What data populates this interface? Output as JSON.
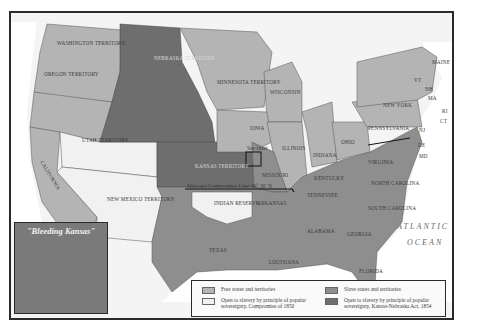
{
  "map": {
    "title": "Kansas-Nebraska Act, 1854",
    "colors": {
      "free": "#b4b4b4",
      "slave": "#8e8e8e",
      "open_1850": "#f1f1f1",
      "open_1854": "#6e6e6e",
      "water": "#ffffff",
      "background": "#f4f4f4"
    },
    "territories": {
      "washington": "WASHINGTON TERRITORY",
      "oregon": "OREGON TERRITORY",
      "nebraska": "NEBRASKA TERRITORY",
      "minnesota": "MINNESOTA TERRITORY",
      "utah": "UTAH TERRITORY",
      "new_mexico": "NEW MEXICO TERRITORY",
      "kansas": "KANSAS TERRITORY",
      "indian_reserve": "INDIAN RESERVE"
    },
    "states": {
      "california": "CALIFORNIA",
      "wisconsin": "WISCONSIN",
      "michigan": "MICHIGAN",
      "iowa": "IOWA",
      "illinois": "ILLINOIS",
      "indiana": "INDIANA",
      "ohio": "OHIO",
      "missouri": "MISSOURI",
      "arkansas": "ARKANSAS",
      "texas": "TEXAS",
      "louisiana": "LOUISIANA",
      "mississippi": "MISSISSIPPI",
      "alabama": "ALABAMA",
      "georgia": "GEORGIA",
      "florida": "FLORIDA",
      "tennessee": "TENNESSEE",
      "kentucky": "KENTUCKY",
      "virginia": "VIRGINIA",
      "north_carolina": "NORTH CAROLINA",
      "south_carolina": "SOUTH CAROLINA",
      "pennsylvania": "PENNSYLVANIA",
      "new_york": "NEW YORK",
      "maine": "MAINE",
      "vt": "VT",
      "nh": "NH",
      "ma": "MA",
      "ri": "RI",
      "ct": "CT",
      "nj": "NJ",
      "de": "DE",
      "md": "MD"
    },
    "lines": {
      "missouri_compromise": "Missouri Compromise Line 36° 30' N",
      "mason_dixon": "Mason and Dixon Line"
    },
    "annotations": {
      "see_inset": "See Inset",
      "ocean": "ATLANTIC OCEAN",
      "ocean_line1": "ATLANTIC",
      "ocean_line2": "OCEAN"
    },
    "inset": {
      "title": "\"Bleeding Kansas\"",
      "places": [
        "Atchison",
        "Leavenworth",
        "Lecompton",
        "Lawrence",
        "Pottawatomie Massacre"
      ],
      "labels": {
        "territory": "KANSAS TERRITORY",
        "missouri": "MISSOURI",
        "river": "MISSOURI R."
      }
    },
    "legend": {
      "items": [
        {
          "key": "free",
          "label": "Free states and territories"
        },
        {
          "key": "slave",
          "label": "Slave states and territories"
        },
        {
          "key": "open_1850",
          "label": "Open to slavery by principle of popular sovereignty, Compromise of 1850"
        },
        {
          "key": "open_1854",
          "label": "Open to slavery by principle of popular sovereignty, Kansas-Nebraska Act, 1854"
        }
      ]
    }
  }
}
